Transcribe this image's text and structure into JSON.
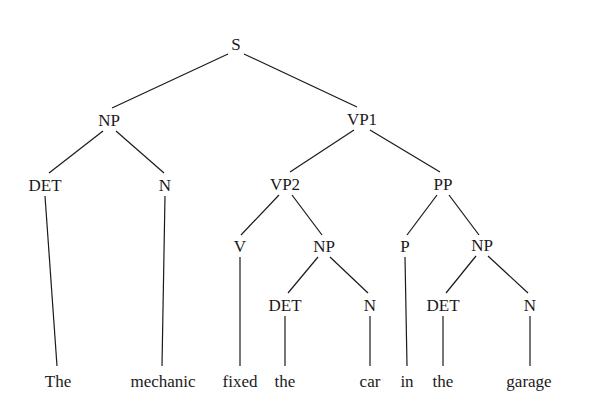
{
  "diagram": {
    "type": "syntax-parse-tree",
    "sentence": "The mechanic fixed the car in the garage",
    "line_color": "#1a1a1a",
    "text_color": "#1a1a1a",
    "background_color": "#ffffff",
    "nodes": [
      {
        "id": "S",
        "label": "S",
        "x": 236,
        "y": 44
      },
      {
        "id": "NP1",
        "label": "NP",
        "x": 109,
        "y": 120
      },
      {
        "id": "VP1",
        "label": "VP1",
        "x": 362,
        "y": 119
      },
      {
        "id": "DET1",
        "label": "DET",
        "x": 45,
        "y": 185
      },
      {
        "id": "N1",
        "label": "N",
        "x": 165,
        "y": 185
      },
      {
        "id": "VP2",
        "label": "VP2",
        "x": 285,
        "y": 184
      },
      {
        "id": "PP",
        "label": "PP",
        "x": 443,
        "y": 184
      },
      {
        "id": "V",
        "label": "V",
        "x": 240,
        "y": 246
      },
      {
        "id": "NP2",
        "label": "NP",
        "x": 324,
        "y": 246
      },
      {
        "id": "P",
        "label": "P",
        "x": 405,
        "y": 246
      },
      {
        "id": "NP3",
        "label": "NP",
        "x": 482,
        "y": 245
      },
      {
        "id": "DET2",
        "label": "DET",
        "x": 285,
        "y": 305
      },
      {
        "id": "N2",
        "label": "N",
        "x": 370,
        "y": 305
      },
      {
        "id": "DET3",
        "label": "DET",
        "x": 443,
        "y": 305
      },
      {
        "id": "N3",
        "label": "N",
        "x": 530,
        "y": 305
      }
    ],
    "leaves": [
      {
        "id": "L1",
        "label": "The",
        "x": 58,
        "y": 381
      },
      {
        "id": "L2",
        "label": "mechanic",
        "x": 163,
        "y": 381
      },
      {
        "id": "L3",
        "label": "fixed",
        "x": 240,
        "y": 381
      },
      {
        "id": "L4",
        "label": "the",
        "x": 285,
        "y": 381
      },
      {
        "id": "L5",
        "label": "car",
        "x": 370,
        "y": 381
      },
      {
        "id": "L6",
        "label": "in",
        "x": 407,
        "y": 381
      },
      {
        "id": "L7",
        "label": "the",
        "x": 443,
        "y": 381
      },
      {
        "id": "L8",
        "label": "garage",
        "x": 529,
        "y": 381
      }
    ],
    "edges": [
      {
        "from": "S",
        "to": "NP1",
        "x1": 228,
        "y1": 54,
        "x2": 112,
        "y2": 108
      },
      {
        "from": "S",
        "to": "VP1",
        "x1": 244,
        "y1": 54,
        "x2": 357,
        "y2": 107
      },
      {
        "from": "NP1",
        "to": "DET1",
        "x1": 103,
        "y1": 131,
        "x2": 49,
        "y2": 173
      },
      {
        "from": "NP1",
        "to": "N1",
        "x1": 116,
        "y1": 131,
        "x2": 164,
        "y2": 173
      },
      {
        "from": "VP1",
        "to": "VP2",
        "x1": 354,
        "y1": 130,
        "x2": 290,
        "y2": 172
      },
      {
        "from": "VP1",
        "to": "PP",
        "x1": 370,
        "y1": 130,
        "x2": 440,
        "y2": 172
      },
      {
        "from": "DET1",
        "to": "L1",
        "x1": 45,
        "y1": 196,
        "x2": 57,
        "y2": 366
      },
      {
        "from": "N1",
        "to": "L2",
        "x1": 165,
        "y1": 196,
        "x2": 162,
        "y2": 366
      },
      {
        "from": "VP2",
        "to": "V",
        "x1": 279,
        "y1": 195,
        "x2": 241,
        "y2": 235
      },
      {
        "from": "VP2",
        "to": "NP2",
        "x1": 292,
        "y1": 195,
        "x2": 322,
        "y2": 235
      },
      {
        "from": "PP",
        "to": "P",
        "x1": 437,
        "y1": 195,
        "x2": 407,
        "y2": 235
      },
      {
        "from": "PP",
        "to": "NP3",
        "x1": 449,
        "y1": 195,
        "x2": 479,
        "y2": 235
      },
      {
        "from": "V",
        "to": "L3",
        "x1": 240,
        "y1": 257,
        "x2": 240,
        "y2": 366
      },
      {
        "from": "NP2",
        "to": "DET2",
        "x1": 318,
        "y1": 257,
        "x2": 288,
        "y2": 293
      },
      {
        "from": "NP2",
        "to": "N2",
        "x1": 330,
        "y1": 257,
        "x2": 368,
        "y2": 293
      },
      {
        "from": "P",
        "to": "L6",
        "x1": 405,
        "y1": 257,
        "x2": 407,
        "y2": 366
      },
      {
        "from": "NP3",
        "to": "DET3",
        "x1": 476,
        "y1": 256,
        "x2": 446,
        "y2": 293
      },
      {
        "from": "NP3",
        "to": "N3",
        "x1": 488,
        "y1": 256,
        "x2": 528,
        "y2": 293
      },
      {
        "from": "DET2",
        "to": "L4",
        "x1": 285,
        "y1": 316,
        "x2": 285,
        "y2": 366
      },
      {
        "from": "N2",
        "to": "L5",
        "x1": 370,
        "y1": 316,
        "x2": 370,
        "y2": 366
      },
      {
        "from": "DET3",
        "to": "L7",
        "x1": 443,
        "y1": 316,
        "x2": 443,
        "y2": 366
      },
      {
        "from": "N3",
        "to": "L8",
        "x1": 530,
        "y1": 316,
        "x2": 530,
        "y2": 366
      }
    ]
  }
}
